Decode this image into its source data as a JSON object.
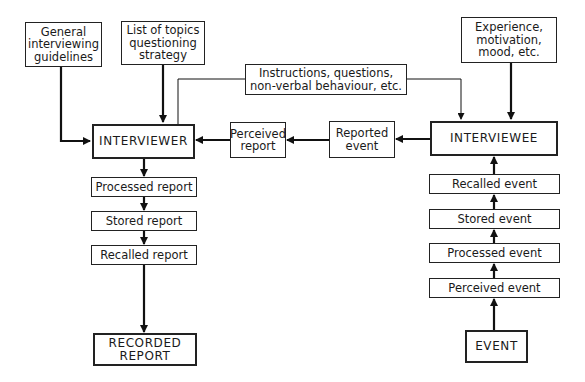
{
  "diagram": {
    "title": "",
    "nodes": {
      "general_guidelines": {
        "label": "General\ninterviewing\nguidelines"
      },
      "topics_strategy": {
        "label": "List of topics\nquestioning\nstrategy"
      },
      "instructions": {
        "label": "Instructions, questions,\nnon-verbal behaviour, etc."
      },
      "experience": {
        "label": "Experience,\nmotivation,\nmood, etc."
      },
      "interviewer": {
        "label": "INTERVIEWER"
      },
      "perceived_report": {
        "label": "Perceived\nreport"
      },
      "reported_event": {
        "label": "Reported\nevent"
      },
      "interviewee": {
        "label": "INTERVIEWEE"
      },
      "processed_report": {
        "label": "Processed report"
      },
      "stored_report": {
        "label": "Stored report"
      },
      "recalled_report": {
        "label": "Recalled report"
      },
      "recorded_report": {
        "label": "RECORDED\nREPORT"
      },
      "recalled_event": {
        "label": "Recalled event"
      },
      "stored_event": {
        "label": "Stored event"
      },
      "processed_event": {
        "label": "Processed event"
      },
      "perceived_event": {
        "label": "Perceived event"
      },
      "event": {
        "label": "EVENT"
      }
    },
    "edges": [
      {
        "from": "general_guidelines",
        "to": "interviewer"
      },
      {
        "from": "topics_strategy",
        "to": "interviewer"
      },
      {
        "from": "interviewer",
        "to": "interviewee",
        "via": "instructions"
      },
      {
        "from": "experience",
        "to": "interviewee"
      },
      {
        "from": "interviewee",
        "to": "reported_event"
      },
      {
        "from": "reported_event",
        "to": "perceived_report"
      },
      {
        "from": "perceived_report",
        "to": "interviewer"
      },
      {
        "from": "interviewer",
        "to": "processed_report"
      },
      {
        "from": "processed_report",
        "to": "stored_report"
      },
      {
        "from": "stored_report",
        "to": "recalled_report"
      },
      {
        "from": "recalled_report",
        "to": "recorded_report"
      },
      {
        "from": "event",
        "to": "perceived_event"
      },
      {
        "from": "perceived_event",
        "to": "processed_event"
      },
      {
        "from": "processed_event",
        "to": "stored_event"
      },
      {
        "from": "stored_event",
        "to": "recalled_event"
      },
      {
        "from": "recalled_event",
        "to": "interviewee"
      }
    ]
  }
}
